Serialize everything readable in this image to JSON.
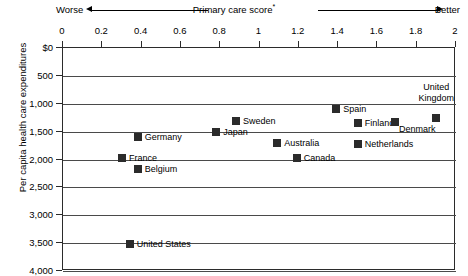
{
  "header": {
    "worse_label": "Worse",
    "better_label": "Better",
    "axis_title": "Primary care score",
    "axis_title_footnote": "*"
  },
  "chart_data": {
    "type": "scatter",
    "title": "",
    "xlabel": "Primary care score*",
    "ylabel": "Per capita health care expenditures",
    "xlim": [
      0,
      2
    ],
    "ylim": [
      0,
      4000
    ],
    "y_inverted": true,
    "grid": true,
    "legend": "none",
    "x_ticks": [
      "0",
      "0.2",
      "0.4",
      "0.6",
      "0.8",
      "1",
      "1.2",
      "1.4",
      "1.6",
      "1.8",
      "2"
    ],
    "x_tick_values": [
      0,
      0.2,
      0.4,
      0.6,
      0.8,
      1.0,
      1.2,
      1.4,
      1.6,
      1.8,
      2.0
    ],
    "y_ticks": [
      "$0",
      "500",
      "1,000",
      "1,500",
      "2,000",
      "2,500",
      "3,000",
      "3,500",
      "4,000"
    ],
    "y_tick_values": [
      0,
      500,
      1000,
      1500,
      2000,
      2500,
      3000,
      3500,
      4000
    ],
    "points": [
      {
        "label": "United States",
        "x": 0.34,
        "y": 3520,
        "label_pos": "right"
      },
      {
        "label": "France",
        "x": 0.3,
        "y": 1975,
        "label_pos": "right"
      },
      {
        "label": "Germany",
        "x": 0.38,
        "y": 1600,
        "label_pos": "right"
      },
      {
        "label": "Belgium",
        "x": 0.38,
        "y": 2170,
        "label_pos": "right"
      },
      {
        "label": "Japan",
        "x": 0.78,
        "y": 1510,
        "label_pos": "right"
      },
      {
        "label": "Sweden",
        "x": 0.88,
        "y": 1310,
        "label_pos": "right"
      },
      {
        "label": "Australia",
        "x": 1.09,
        "y": 1710,
        "label_pos": "right"
      },
      {
        "label": "Canada",
        "x": 1.19,
        "y": 1975,
        "label_pos": "right"
      },
      {
        "label": "Spain",
        "x": 1.39,
        "y": 1095,
        "label_pos": "right"
      },
      {
        "label": "Netherlands",
        "x": 1.5,
        "y": 1725,
        "label_pos": "right"
      },
      {
        "label": "Finland",
        "x": 1.5,
        "y": 1345,
        "label_pos": "right"
      },
      {
        "label": "Denmark",
        "x": 1.69,
        "y": 1330,
        "label_pos": "below-right"
      },
      {
        "label": "United Kingdom",
        "x": 1.9,
        "y": 1255,
        "label_pos": "above-center"
      }
    ]
  }
}
